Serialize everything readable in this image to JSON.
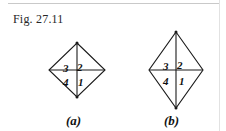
{
  "figure": {
    "caption": "Fig. 27.11",
    "ink_color": "#1a1a1a",
    "background_color": "#ffffff",
    "panels": [
      {
        "id": "a",
        "label": "(a)",
        "shape": "rhombus",
        "description": "square-proportioned rhombus divided into four triangular quadrants by its two diagonals",
        "quadrants": [
          {
            "position": "top-left",
            "number": "3"
          },
          {
            "position": "top-right",
            "number": "2"
          },
          {
            "position": "bottom-left",
            "number": "4"
          },
          {
            "position": "bottom-right",
            "number": "1"
          }
        ]
      },
      {
        "id": "b",
        "label": "(b)",
        "shape": "rhombus",
        "description": "tall elongated rhombus divided into four triangular quadrants by its two diagonals",
        "quadrants": [
          {
            "position": "top-left",
            "number": "3"
          },
          {
            "position": "top-right",
            "number": "2"
          },
          {
            "position": "bottom-left",
            "number": "4"
          },
          {
            "position": "bottom-right",
            "number": "1"
          }
        ]
      }
    ]
  }
}
